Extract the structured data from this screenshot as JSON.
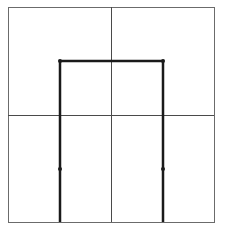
{
  "diagram": {
    "canvas": {
      "width": 226,
      "height": 242,
      "background": "#ffffff"
    },
    "frame": {
      "x1": 8,
      "y1": 7,
      "x2": 214,
      "y2": 222,
      "stroke": "#6b6b6b",
      "stroke_width": 1
    },
    "grid": {
      "vertical_midline_x": 111,
      "horizontal_midline_y": 115,
      "stroke": "#4a4a4a",
      "stroke_width": 1
    },
    "shape": {
      "type": "inverted-U",
      "stroke": "#1a1a1a",
      "stroke_width": 2.5,
      "points": [
        [
          60,
          222
        ],
        [
          60,
          61
        ],
        [
          163,
          61
        ],
        [
          163,
          222
        ]
      ]
    },
    "nodes": [
      {
        "x": 60,
        "y": 61
      },
      {
        "x": 163,
        "y": 61
      },
      {
        "x": 60,
        "y": 169
      },
      {
        "x": 163,
        "y": 169
      }
    ],
    "node_color": "#1a1a1a",
    "node_radius": 2
  }
}
